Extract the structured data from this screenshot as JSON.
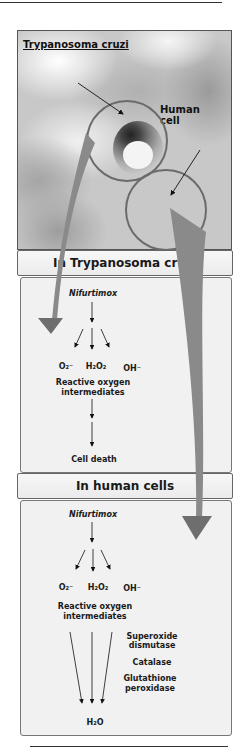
{
  "figure": {
    "photo": {
      "label_parasite": "Trypanosoma cruzi",
      "label_human_cell": "Human cell"
    },
    "sections": [
      {
        "header": "In Trypanosoma cruzi",
        "drug": "Nifurtimox",
        "species": [
          "O₂⁻",
          "H₂O₂",
          "OH⁻"
        ],
        "group_label_line1": "Reactive oxygen",
        "group_label_line2": "intermediates",
        "outcome": "Cell death"
      },
      {
        "header": "In human cells",
        "drug": "Nifurtimox",
        "species": [
          "O₂⁻",
          "H₂O₂",
          "OH⁻"
        ],
        "group_label_line1": "Reactive oxygen",
        "group_label_line2": "intermediates",
        "enzymes": [
          {
            "line1": "Superoxide",
            "line2": "dismutase"
          },
          {
            "line1": "Catalase",
            "line2": ""
          },
          {
            "line1": "Glutathione",
            "line2": "peroxidase"
          }
        ],
        "outcome": "H₂O"
      }
    ],
    "colors": {
      "big_arrow": "#6e6e6e",
      "panel_bg": "#f1f1f1",
      "header_bg": "#eeeeee",
      "circle_stroke": "#6b6b6b"
    }
  }
}
